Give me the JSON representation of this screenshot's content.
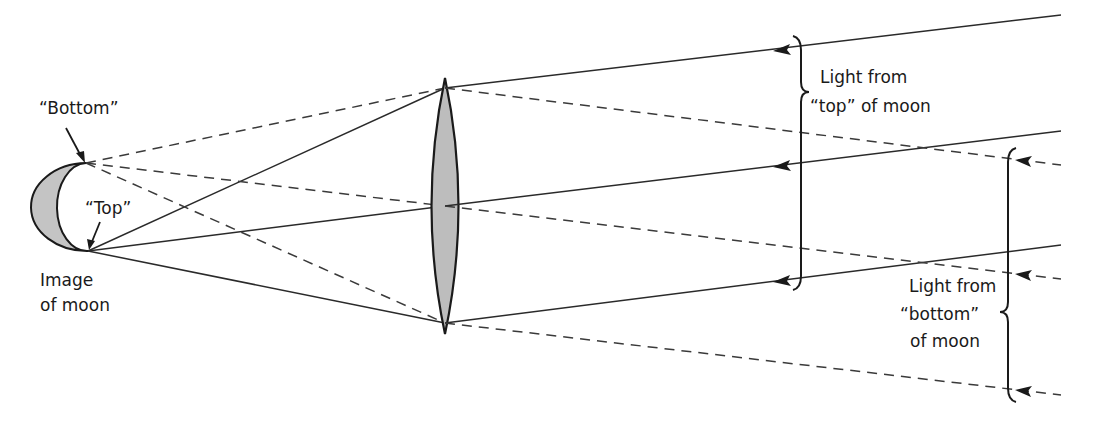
{
  "diagram": {
    "colors": {
      "line": "#2a2a2a",
      "lens_fill": "#bdbdbd",
      "moon_fill": "#c4c4c4",
      "background": "#ffffff"
    },
    "labels": {
      "bottom": "“Bottom”",
      "top": "“Top”",
      "image_line1": "Image",
      "image_line2": "of moon",
      "light_top_line1": "Light from",
      "light_top_line2": "“top” of moon",
      "light_bottom_line1": "Light from",
      "light_bottom_line2": "“bottom”",
      "light_bottom_line3": "of moon"
    },
    "elements": {
      "lens": "converging-lens",
      "moon_image": "crescent-image-of-moon",
      "solid_rays": "light-from-top-of-moon",
      "dashed_rays": "light-from-bottom-of-moon"
    }
  }
}
